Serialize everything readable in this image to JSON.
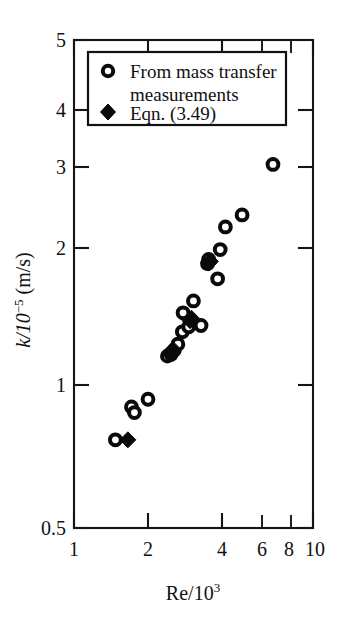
{
  "chart_data": {
    "type": "scatter",
    "title": "",
    "xlabel": "Re/10^3",
    "xlabel_base": "Re/10",
    "xlabel_exp": "3",
    "ylabel": "k/10^-5 (m/s)",
    "ylabel_base": "k/10",
    "ylabel_exp": "−5",
    "ylabel_tail": " (m/s)",
    "xscale": "log",
    "yscale": "log",
    "xlim": [
      1,
      10
    ],
    "ylim": [
      0.5,
      5
    ],
    "grid": false,
    "xticks": [
      1,
      2,
      4,
      6,
      8,
      10
    ],
    "xticklabels": [
      "1",
      "2",
      "4",
      "6",
      "8",
      "10"
    ],
    "yticks": [
      0.5,
      1,
      2,
      3,
      4,
      5
    ],
    "yticklabels": [
      "0.5",
      "1",
      "2",
      "3",
      "4",
      "5"
    ],
    "legend_position": "upper-left-inside",
    "series": [
      {
        "name": "From mass transfer measurements",
        "marker": "open-circle",
        "color": "#0a0a0a",
        "points": [
          [
            1.49,
            0.758
          ],
          [
            1.74,
            0.885
          ],
          [
            1.79,
            0.862
          ],
          [
            2.04,
            0.918
          ],
          [
            2.46,
            1.125
          ],
          [
            2.55,
            1.135
          ],
          [
            2.63,
            1.158
          ],
          [
            2.72,
            1.19
          ],
          [
            2.84,
            1.262
          ],
          [
            2.86,
            1.38
          ],
          [
            3.02,
            1.292
          ],
          [
            3.16,
            1.46
          ],
          [
            3.4,
            1.3
          ],
          [
            3.62,
            1.74
          ],
          [
            3.66,
            1.775
          ],
          [
            3.99,
            1.62
          ],
          [
            4.09,
            1.86
          ],
          [
            4.3,
            2.07
          ],
          [
            5.05,
            2.19
          ],
          [
            6.8,
            2.78
          ]
        ]
      },
      {
        "name": "Eqn. (3.49)",
        "marker": "filled-diamond",
        "color": "#0a0a0a",
        "points": [
          [
            1.68,
            0.758
          ],
          [
            2.52,
            1.14
          ],
          [
            2.55,
            1.15
          ],
          [
            2.6,
            1.16
          ],
          [
            3.06,
            1.33
          ],
          [
            3.1,
            1.345
          ],
          [
            3.66,
            1.745
          ],
          [
            3.72,
            1.76
          ]
        ]
      }
    ]
  },
  "legend": {
    "entries": [
      {
        "marker": "open-circle",
        "label_line1": "From mass transfer",
        "label_line2": "measurements"
      },
      {
        "marker": "filled-diamond",
        "label_line1": "Eqn. (3.49)",
        "label_line2": ""
      }
    ]
  }
}
